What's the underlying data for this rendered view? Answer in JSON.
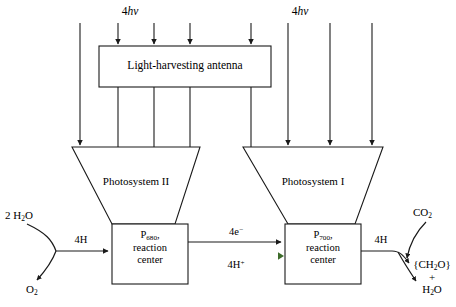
{
  "figure": {
    "colors": {
      "line": "#1a1a1a",
      "proton_start": "#2b3fc4",
      "proton_end": "#3d6b2a",
      "background": "#ffffff"
    }
  },
  "photons": {
    "left": "4hv",
    "right": "4hv",
    "count": "4",
    "symbol": "hv"
  },
  "antenna": {
    "label": "Light-harvesting antenna",
    "input_arrows": 4,
    "output_lines": 4
  },
  "photosystems": {
    "two": {
      "label": "Photosystem II",
      "reaction_center": {
        "pigment": "P",
        "subscript": "680",
        "suffix": ",",
        "line2": "reaction",
        "line3": "center"
      }
    },
    "one": {
      "label": "Photosystem I",
      "reaction_center": {
        "pigment": "P",
        "subscript": "700",
        "suffix": ",",
        "line2": "reaction",
        "line3": "center"
      }
    }
  },
  "inputs": {
    "water": {
      "coefficient": "2",
      "formula": "H",
      "sub": "2",
      "formula2": "O",
      "display": "2 H2O"
    },
    "carbon_dioxide": {
      "formula": "CO",
      "sub": "2",
      "display": "CO2"
    }
  },
  "outputs": {
    "oxygen": {
      "formula": "O",
      "sub": "2",
      "display": "O2"
    },
    "carbohydrate": {
      "display": "{CH2O}",
      "prefix": "{CH",
      "sub": "2",
      "suffix": "O}"
    },
    "plus": "+",
    "water_out": {
      "formula": "H",
      "sub": "2",
      "suffix": "O",
      "display": "H2O"
    }
  },
  "flows": {
    "protons_in": "4H",
    "electrons": {
      "text": "4e",
      "charge": "−",
      "display": "4e-"
    },
    "protons_transfer": {
      "text": "4H",
      "charge": "+",
      "display": "4H+"
    },
    "protons_out": "4H"
  }
}
